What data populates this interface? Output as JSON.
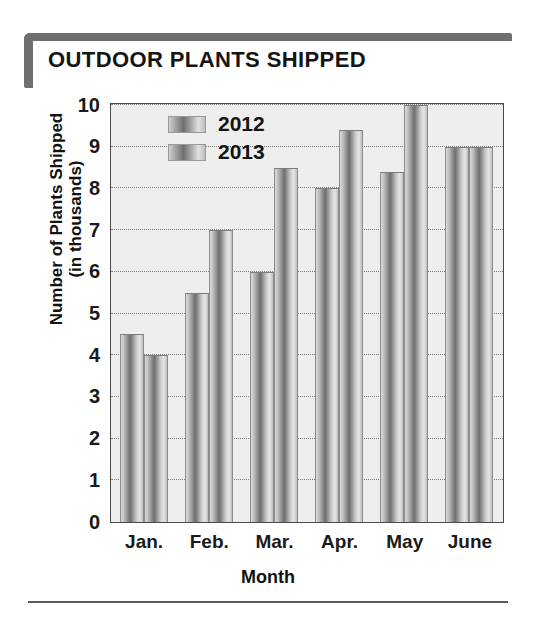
{
  "header": {
    "title": "OUTDOOR PLANTS SHIPPED"
  },
  "chart_data": {
    "type": "bar",
    "title": "OUTDOOR PLANTS SHIPPED",
    "xlabel": "Month",
    "ylabel": "Number of Plants Shipped (in thousands)",
    "ylabel_line1": "Number of Plants Shipped",
    "ylabel_line2": "(in thousands)",
    "categories": [
      "Jan.",
      "Feb.",
      "Mar.",
      "Apr.",
      "May",
      "June"
    ],
    "series": [
      {
        "name": "2012",
        "values": [
          4.5,
          5.5,
          6.0,
          8.0,
          8.4,
          9.0
        ]
      },
      {
        "name": "2013",
        "values": [
          4.0,
          7.0,
          8.5,
          9.4,
          10.0,
          9.0
        ]
      }
    ],
    "ylim": [
      0,
      10
    ],
    "yticks": [
      0,
      1,
      2,
      3,
      4,
      5,
      6,
      7,
      8,
      9,
      10
    ],
    "ytick_labels": [
      "0",
      "1",
      "2",
      "3",
      "4",
      "5",
      "6",
      "7",
      "8",
      "9",
      "10"
    ],
    "grid": true,
    "grid_axis": "y",
    "legend_position": "top-left-inside",
    "bar_style": "gradient-cylinder",
    "colors": {
      "bar_light": "#e6e6e6",
      "bar_dark": "#6e6e6e",
      "plot_background": "#eeeeee",
      "frame": "#4a4a4a",
      "gridline": "#7a7a7a",
      "title_accent": "#6f6f6f",
      "text": "#141414"
    }
  }
}
